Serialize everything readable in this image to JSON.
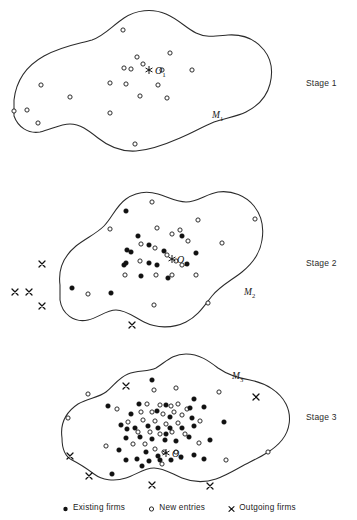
{
  "figure": {
    "title_hidden": "",
    "background_color": "#ffffff",
    "line_color": "#2b2b2b",
    "filled_marker_color": "#111111",
    "open_marker_fill": "#ffffff"
  },
  "stages": [
    {
      "id": "stage-1",
      "label": "Stage 1",
      "label_x": 306,
      "label_y": 78,
      "market_label": "M",
      "market_subscript": "1",
      "market_label_x": 212,
      "market_label_y": 110,
      "center_label": "O",
      "center_subscript": "1",
      "center_label_x": 155,
      "center_label_y": 65,
      "star_x": 149,
      "star_y": 70,
      "boundary": "M 14,100 C 16,82 26,66 44,56 C 62,46 78,44 92,40 C 104,36 112,26 124,18 C 136,10 152,8 166,14 C 178,19 186,28 196,33 C 206,38 216,36 228,35 C 244,34 256,40 264,50 C 272,60 273,72 270,84 C 267,96 258,106 246,112 C 236,117 224,118 214,122 C 202,127 192,133 180,138 C 164,145 150,150 136,151 C 120,152 108,146 98,138 C 88,130 80,124 70,124 C 60,124 50,130 40,132 C 28,134 18,127 14,116 Z",
      "new_entries": [
        {
          "x": 123,
          "y": 30
        },
        {
          "x": 137,
          "y": 57
        },
        {
          "x": 170,
          "y": 53
        },
        {
          "x": 124,
          "y": 68
        },
        {
          "x": 131,
          "y": 69
        },
        {
          "x": 143,
          "y": 64
        },
        {
          "x": 162,
          "y": 70
        },
        {
          "x": 192,
          "y": 70
        },
        {
          "x": 110,
          "y": 83
        },
        {
          "x": 126,
          "y": 84
        },
        {
          "x": 158,
          "y": 85
        },
        {
          "x": 41,
          "y": 85
        },
        {
          "x": 70,
          "y": 97
        },
        {
          "x": 140,
          "y": 96
        },
        {
          "x": 167,
          "y": 98
        },
        {
          "x": 14,
          "y": 111
        },
        {
          "x": 27,
          "y": 110
        },
        {
          "x": 110,
          "y": 113
        },
        {
          "x": 38,
          "y": 123
        },
        {
          "x": 135,
          "y": 144
        }
      ],
      "existing_firms": [],
      "outgoing_firms": []
    },
    {
      "id": "stage-2",
      "label": "Stage 2",
      "label_x": 306,
      "label_y": 258,
      "market_label": "M",
      "market_subscript": "2",
      "market_label_x": 244,
      "market_label_y": 287,
      "center_label": "O",
      "center_subscript": "2",
      "center_label_x": 177,
      "center_label_y": 254,
      "star_x": 172,
      "star_y": 259,
      "boundary": "M 60,285 C 58,270 64,256 76,246 C 86,238 96,234 104,226 C 112,218 116,206 126,199 C 136,192 148,191 158,194 C 168,197 176,202 186,202 C 198,202 206,194 218,192 C 232,190 246,196 254,206 C 262,216 264,228 262,240 C 260,254 252,264 242,272 C 232,280 220,286 212,296 C 204,306 198,316 186,322 C 172,329 156,328 144,322 C 134,317 126,310 116,310 C 106,310 98,318 88,320 C 74,323 62,314 60,300 Z",
      "new_entries": [
        {
          "x": 152,
          "y": 202
        },
        {
          "x": 110,
          "y": 229
        },
        {
          "x": 157,
          "y": 228
        },
        {
          "x": 198,
          "y": 220
        },
        {
          "x": 255,
          "y": 219
        },
        {
          "x": 172,
          "y": 234
        },
        {
          "x": 180,
          "y": 230
        },
        {
          "x": 141,
          "y": 244
        },
        {
          "x": 155,
          "y": 248
        },
        {
          "x": 188,
          "y": 241
        },
        {
          "x": 222,
          "y": 243
        },
        {
          "x": 140,
          "y": 261
        },
        {
          "x": 167,
          "y": 255
        },
        {
          "x": 176,
          "y": 261
        },
        {
          "x": 182,
          "y": 265
        },
        {
          "x": 125,
          "y": 275
        },
        {
          "x": 156,
          "y": 275
        },
        {
          "x": 172,
          "y": 275
        },
        {
          "x": 196,
          "y": 275
        },
        {
          "x": 88,
          "y": 294
        },
        {
          "x": 154,
          "y": 305
        },
        {
          "x": 208,
          "y": 303
        }
      ],
      "existing_firms": [
        {
          "x": 126,
          "y": 211
        },
        {
          "x": 138,
          "y": 236
        },
        {
          "x": 127,
          "y": 250
        },
        {
          "x": 131,
          "y": 252
        },
        {
          "x": 149,
          "y": 245
        },
        {
          "x": 182,
          "y": 236
        },
        {
          "x": 164,
          "y": 251
        },
        {
          "x": 149,
          "y": 263
        },
        {
          "x": 124,
          "y": 265
        },
        {
          "x": 126,
          "y": 263
        },
        {
          "x": 157,
          "y": 265
        },
        {
          "x": 196,
          "y": 253
        },
        {
          "x": 141,
          "y": 276
        },
        {
          "x": 168,
          "y": 278
        },
        {
          "x": 72,
          "y": 288
        },
        {
          "x": 111,
          "y": 293
        },
        {
          "x": 187,
          "y": 264
        }
      ],
      "outgoing_firms": [
        {
          "x": 42,
          "y": 264
        },
        {
          "x": 15,
          "y": 292
        },
        {
          "x": 29,
          "y": 292
        },
        {
          "x": 42,
          "y": 306
        },
        {
          "x": 132,
          "y": 325
        }
      ]
    },
    {
      "id": "stage-3",
      "label": "Stage 3",
      "label_x": 306,
      "label_y": 412,
      "market_label": "M",
      "market_subscript": "3",
      "market_label_x": 232,
      "market_label_y": 371,
      "center_label": "O",
      "center_subscript": "3",
      "center_label_x": 172,
      "center_label_y": 448,
      "star_x": 166,
      "star_y": 453,
      "boundary": "M 62,438 C 60,424 66,412 78,404 C 88,398 98,398 106,392 C 114,386 118,378 128,374 C 138,370 148,372 156,368 C 166,362 172,354 186,354 C 200,354 210,362 218,368 C 228,375 238,378 250,380 C 266,383 280,392 286,404 C 292,416 290,430 282,440 C 274,450 262,456 250,462 C 238,468 228,475 216,479 C 204,483 192,482 182,478 C 172,474 164,468 154,468 C 144,468 136,475 126,478 C 114,482 102,480 94,474 C 86,468 80,464 72,460 C 64,456 62,448 62,438 Z",
      "new_entries": [
        {
          "x": 154,
          "y": 390
        },
        {
          "x": 176,
          "y": 388
        },
        {
          "x": 219,
          "y": 392
        },
        {
          "x": 88,
          "y": 394
        },
        {
          "x": 117,
          "y": 409
        },
        {
          "x": 147,
          "y": 404
        },
        {
          "x": 160,
          "y": 405
        },
        {
          "x": 171,
          "y": 406
        },
        {
          "x": 178,
          "y": 404
        },
        {
          "x": 187,
          "y": 409
        },
        {
          "x": 141,
          "y": 412
        },
        {
          "x": 152,
          "y": 412
        },
        {
          "x": 163,
          "y": 414
        },
        {
          "x": 174,
          "y": 412
        },
        {
          "x": 182,
          "y": 415
        },
        {
          "x": 128,
          "y": 422
        },
        {
          "x": 143,
          "y": 420
        },
        {
          "x": 155,
          "y": 421
        },
        {
          "x": 166,
          "y": 424
        },
        {
          "x": 178,
          "y": 423
        },
        {
          "x": 200,
          "y": 421
        },
        {
          "x": 138,
          "y": 432
        },
        {
          "x": 150,
          "y": 432
        },
        {
          "x": 160,
          "y": 434
        },
        {
          "x": 172,
          "y": 432
        },
        {
          "x": 185,
          "y": 434
        },
        {
          "x": 106,
          "y": 446
        },
        {
          "x": 133,
          "y": 444
        },
        {
          "x": 145,
          "y": 444
        },
        {
          "x": 155,
          "y": 449
        },
        {
          "x": 164,
          "y": 452
        },
        {
          "x": 176,
          "y": 452
        },
        {
          "x": 199,
          "y": 443
        },
        {
          "x": 162,
          "y": 464
        },
        {
          "x": 226,
          "y": 460
        },
        {
          "x": 268,
          "y": 452
        },
        {
          "x": 68,
          "y": 418
        }
      ],
      "existing_firms": [
        {
          "x": 152,
          "y": 380
        },
        {
          "x": 194,
          "y": 399
        },
        {
          "x": 108,
          "y": 406
        },
        {
          "x": 166,
          "y": 405
        },
        {
          "x": 190,
          "y": 408
        },
        {
          "x": 204,
          "y": 407
        },
        {
          "x": 131,
          "y": 414
        },
        {
          "x": 139,
          "y": 404
        },
        {
          "x": 157,
          "y": 411
        },
        {
          "x": 170,
          "y": 417
        },
        {
          "x": 192,
          "y": 418
        },
        {
          "x": 121,
          "y": 425
        },
        {
          "x": 127,
          "y": 429
        },
        {
          "x": 135,
          "y": 428
        },
        {
          "x": 148,
          "y": 426
        },
        {
          "x": 158,
          "y": 428
        },
        {
          "x": 170,
          "y": 428
        },
        {
          "x": 182,
          "y": 428
        },
        {
          "x": 194,
          "y": 426
        },
        {
          "x": 224,
          "y": 422
        },
        {
          "x": 126,
          "y": 438
        },
        {
          "x": 140,
          "y": 437
        },
        {
          "x": 152,
          "y": 439
        },
        {
          "x": 165,
          "y": 440
        },
        {
          "x": 176,
          "y": 441
        },
        {
          "x": 189,
          "y": 437
        },
        {
          "x": 210,
          "y": 440
        },
        {
          "x": 119,
          "y": 450
        },
        {
          "x": 146,
          "y": 452
        },
        {
          "x": 158,
          "y": 456
        },
        {
          "x": 171,
          "y": 460
        },
        {
          "x": 181,
          "y": 457
        },
        {
          "x": 194,
          "y": 455
        },
        {
          "x": 126,
          "y": 460
        },
        {
          "x": 137,
          "y": 459
        },
        {
          "x": 149,
          "y": 461
        },
        {
          "x": 160,
          "y": 460
        },
        {
          "x": 204,
          "y": 459
        },
        {
          "x": 142,
          "y": 466
        },
        {
          "x": 112,
          "y": 474
        },
        {
          "x": 166,
          "y": 434
        }
      ],
      "outgoing_firms": [
        {
          "x": 126,
          "y": 386
        },
        {
          "x": 256,
          "y": 397
        },
        {
          "x": 70,
          "y": 456
        },
        {
          "x": 89,
          "y": 476
        },
        {
          "x": 152,
          "y": 485
        },
        {
          "x": 210,
          "y": 486
        }
      ]
    }
  ],
  "legend": {
    "items": [
      {
        "glyph": "filled-circle-icon",
        "label": "Existing firms"
      },
      {
        "glyph": "open-circle-icon",
        "label": "New entries"
      },
      {
        "glyph": "cross-icon",
        "label": "Outgoing firms"
      }
    ]
  }
}
